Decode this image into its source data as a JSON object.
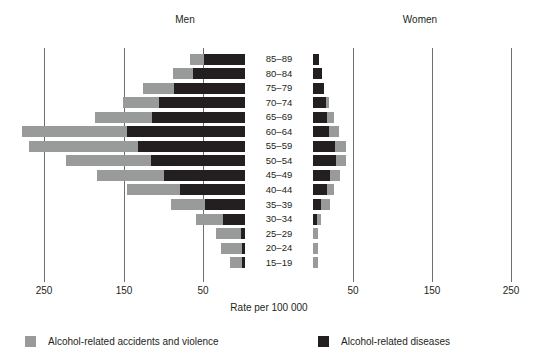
{
  "panels": {
    "left_title": "Men",
    "right_title": "Women"
  },
  "axis": {
    "title": "Rate per 100 000",
    "left_ticks": [
      "250",
      "150",
      "50"
    ],
    "right_ticks": [
      "50",
      "150",
      "250"
    ]
  },
  "legend": [
    {
      "label": "Alcohol-related accidents and violence",
      "color": "#999a9a",
      "key": "accidents"
    },
    {
      "label": "Alcohol-related diseases",
      "color": "#231f20",
      "key": "diseases"
    }
  ],
  "colors": {
    "accidents": "#999a9a",
    "diseases": "#231f20",
    "gridline": "#6d6e71",
    "text": "#231f20",
    "background": "#ffffff"
  },
  "chart_data": {
    "type": "bar",
    "subtype": "population-pyramid-stacked",
    "title": "",
    "xlabel": "Rate per 100 000",
    "ylabel": "",
    "orientation": "horizontal",
    "stacked": true,
    "grid": true,
    "legend_position": "bottom",
    "xlim_left": [
      0,
      280
    ],
    "xlim_right": [
      0,
      280
    ],
    "xticks_left": [
      250,
      150,
      50
    ],
    "xticks_right": [
      50,
      150,
      250
    ],
    "categories": [
      "85–89",
      "80–84",
      "75–79",
      "70–74",
      "65–69",
      "60–64",
      "55–59",
      "50–54",
      "45–49",
      "40–44",
      "35–39",
      "30–34",
      "25–29",
      "20–24",
      "15–19"
    ],
    "panels": [
      {
        "name": "Men",
        "direction": "left",
        "series": [
          {
            "name": "Alcohol-related diseases",
            "values": [
              52,
              66,
              89,
              108,
              117,
              148,
              134,
              118,
              102,
              82,
              50,
              28,
              5,
              4,
              4
            ]
          },
          {
            "name": "Alcohol-related accidents and violence",
            "values": [
              17,
              24,
              39,
              46,
              72,
              132,
              138,
              107,
              84,
              66,
              43,
              34,
              32,
              26,
              15
            ]
          }
        ],
        "totals": [
          69,
          90,
          128,
          154,
          189,
          280,
          272,
          225,
          186,
          148,
          93,
          62,
          37,
          30,
          19
        ]
      },
      {
        "name": "Women",
        "direction": "right",
        "series": [
          {
            "name": "Alcohol-related diseases",
            "values": [
              8,
              11,
              14,
              16,
              18,
              20,
              28,
              29,
              21,
              17,
              10,
              5,
              0,
              0,
              0
            ]
          },
          {
            "name": "Alcohol-related accidents and violence",
            "values": [
              0,
              0,
              0,
              4,
              8,
              13,
              14,
              13,
              13,
              9,
              12,
              5,
              6,
              6,
              6
            ]
          }
        ],
        "totals": [
          8,
          11,
          14,
          20,
          26,
          33,
          42,
          42,
          34,
          26,
          22,
          10,
          6,
          6,
          6
        ]
      }
    ]
  }
}
